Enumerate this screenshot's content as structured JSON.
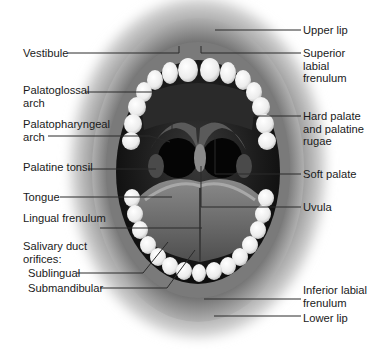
{
  "diagram": {
    "labels_left": [
      {
        "id": "vestibule",
        "text": "Vestibule",
        "x": 23,
        "y": 47
      },
      {
        "id": "palatoglossal-arch",
        "text": "Palatoglossal\narch",
        "x": 23,
        "y": 84
      },
      {
        "id": "palatopharyngeal-arch",
        "text": "Palatopharyngeal\narch",
        "x": 23,
        "y": 118
      },
      {
        "id": "palatine-tonsil",
        "text": "Palatine tonsil",
        "x": 23,
        "y": 161
      },
      {
        "id": "tongue",
        "text": "Tongue",
        "x": 23,
        "y": 191
      },
      {
        "id": "lingual-frenulum",
        "text": "Lingual frenulum",
        "x": 23,
        "y": 212
      },
      {
        "id": "salivary-duct-orifices",
        "text": "Salivary duct\norifices:",
        "x": 23,
        "y": 240
      },
      {
        "id": "sublingual",
        "text": "Sublingual",
        "x": 28,
        "y": 267
      },
      {
        "id": "submandibular",
        "text": "Submandibular",
        "x": 28,
        "y": 282
      }
    ],
    "labels_right": [
      {
        "id": "upper-lip",
        "text": "Upper lip",
        "x": 303,
        "y": 24
      },
      {
        "id": "superior-labial-frenulum",
        "text": "Superior\nlabial\nfrenulum",
        "x": 303,
        "y": 47
      },
      {
        "id": "hard-palate",
        "text": "Hard palate\nand palatine\nrugae",
        "x": 303,
        "y": 110
      },
      {
        "id": "soft-palate",
        "text": "Soft palate",
        "x": 303,
        "y": 168
      },
      {
        "id": "uvula",
        "text": "Uvula",
        "x": 303,
        "y": 201
      },
      {
        "id": "inferior-labial-frenulum",
        "text": "Inferior labial\nfrenulum",
        "x": 303,
        "y": 284
      },
      {
        "id": "lower-lip",
        "text": "Lower lip",
        "x": 303,
        "y": 312
      }
    ],
    "leader_lines": [
      {
        "for": "vestibule",
        "points": "68,53 179,53 179,46"
      },
      {
        "for": "palatoglossal-arch",
        "points": "85,92 172,92 172,129"
      },
      {
        "for": "palatopharyngeal-arch",
        "points": "48,136 150,136 170,142"
      },
      {
        "for": "palatine-tonsil",
        "points": "88,169 156,169"
      },
      {
        "for": "tongue",
        "points": "60,197 172,197"
      },
      {
        "for": "lingual-frenulum",
        "points": "100,228 202,228"
      },
      {
        "for": "sublingual",
        "points": "77,273 143,273 168,242"
      },
      {
        "for": "submandibular",
        "points": "100,288 167,288 195,250"
      },
      {
        "for": "upper-lip",
        "points": "301,30 215,30"
      },
      {
        "for": "superior-labial-frenulum",
        "points": "301,53 201,53 201,46"
      },
      {
        "for": "hard-palate",
        "points": "301,116 215,116"
      },
      {
        "for": "soft-palate",
        "points": "301,174 215,174 215,137"
      },
      {
        "for": "uvula",
        "points": "301,207 201,207 201,166"
      },
      {
        "for": "inferior-labial-frenulum",
        "points": "301,299 204,299"
      },
      {
        "for": "lower-lip",
        "points": "301,316 214,316"
      }
    ],
    "colors": {
      "text": "#1a1a1a",
      "leader": "#2a2a2a",
      "lip": "#9a9a9a",
      "cavity": "#141414",
      "tooth": "#f4f4f4",
      "tongue": "#6e6e6e"
    }
  }
}
